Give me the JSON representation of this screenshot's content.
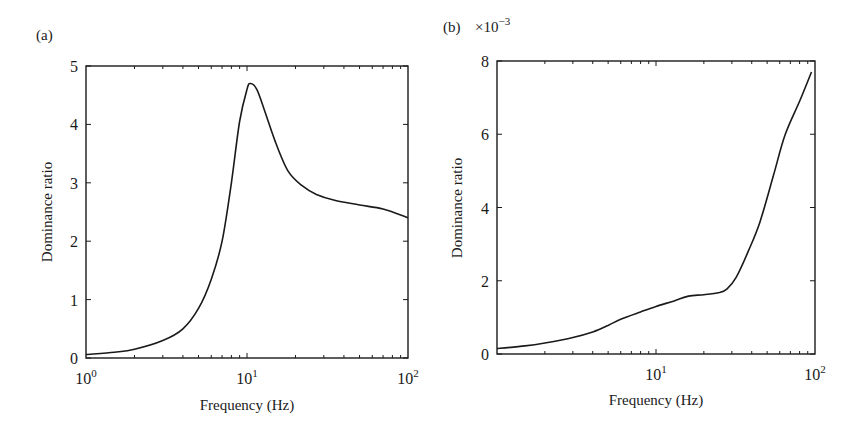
{
  "chart_data": [
    {
      "panel_label": "(a)",
      "type": "line",
      "title": "",
      "xlabel": "Frequency (Hz)",
      "ylabel": "Dominance ratio",
      "xscale": "log",
      "xlim": [
        1,
        100
      ],
      "ylim": [
        0,
        5
      ],
      "x_tick_labels": [
        {
          "base": "10",
          "exp": "0",
          "value": 1
        },
        {
          "base": "10",
          "exp": "1",
          "value": 10
        },
        {
          "base": "10",
          "exp": "2",
          "value": 100
        }
      ],
      "y_ticks": [
        0,
        1,
        2,
        3,
        4,
        5
      ],
      "y_multiplier": "",
      "grid": false,
      "series": [
        {
          "name": "Dominance ratio",
          "x": [
            1,
            1.5,
            2,
            3,
            4,
            5,
            6,
            7,
            8,
            9,
            10,
            10.5,
            11.5,
            13,
            15,
            18,
            22,
            27,
            35,
            50,
            70,
            100
          ],
          "y": [
            0.06,
            0.1,
            0.15,
            0.3,
            0.5,
            0.85,
            1.35,
            2.0,
            3.0,
            4.05,
            4.6,
            4.7,
            4.6,
            4.2,
            3.7,
            3.2,
            2.95,
            2.8,
            2.7,
            2.62,
            2.55,
            2.4
          ]
        }
      ]
    },
    {
      "panel_label": "(b)",
      "type": "line",
      "title": "",
      "xlabel": "Frequency (Hz)",
      "ylabel": "Dominance ratio",
      "xscale": "log",
      "xlim": [
        1,
        100
      ],
      "ylim": [
        0,
        0.008
      ],
      "x_tick_labels": [
        {
          "base": "10",
          "exp": "1",
          "value": 10
        },
        {
          "base": "10",
          "exp": "2",
          "value": 100
        }
      ],
      "y_ticks": [
        0,
        2,
        4,
        6,
        8
      ],
      "y_multiplier": "×10",
      "y_multiplier_exp": "−3",
      "grid": false,
      "series": [
        {
          "name": "Dominance ratio (×10^-3)",
          "x": [
            1,
            1.5,
            2,
            3,
            4,
            5,
            6,
            8,
            10,
            13,
            16,
            20,
            25,
            28,
            32,
            38,
            45,
            55,
            65,
            80,
            95
          ],
          "y": [
            0.15,
            0.22,
            0.3,
            0.45,
            0.6,
            0.78,
            0.95,
            1.15,
            1.3,
            1.45,
            1.58,
            1.62,
            1.68,
            1.78,
            2.1,
            2.8,
            3.6,
            4.9,
            6.0,
            6.9,
            7.7
          ]
        }
      ]
    }
  ]
}
